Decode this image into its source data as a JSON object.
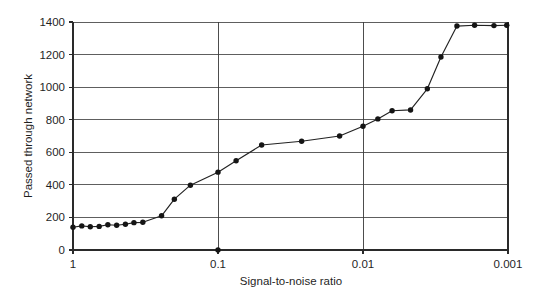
{
  "chart_data": {
    "type": "line",
    "title": "",
    "xlabel": "Signal-to-noise ratio",
    "ylabel": "Passed through network",
    "xscale": "log",
    "x_axis_reversed": true,
    "grid": true,
    "legend": "none",
    "xlim": [
      1,
      0.001
    ],
    "ylim": [
      0,
      1400
    ],
    "x_tick_labels": [
      "1",
      "0.1",
      "0.01",
      "0.001"
    ],
    "x_ticks": [
      1,
      0.1,
      0.01,
      0.001
    ],
    "y_tick_labels": [
      "0",
      "200",
      "400",
      "600",
      "800",
      "1000",
      "1200",
      "1400"
    ],
    "y_ticks": [
      0,
      200,
      400,
      600,
      800,
      1000,
      1200,
      1400
    ],
    "marker": "filled-circle",
    "x": [
      1.0,
      0.87,
      0.76,
      0.66,
      0.575,
      0.5,
      0.435,
      0.38,
      0.33,
      0.245,
      0.2,
      0.155,
      0.1,
      0.075,
      0.05,
      0.0265,
      0.0145,
      0.01,
      0.0079,
      0.0063,
      0.0047,
      0.0036,
      0.0029,
      0.00225,
      0.0017,
      0.00125,
      0.00102
    ],
    "values": [
      140,
      148,
      143,
      145,
      155,
      152,
      158,
      168,
      170,
      210,
      312,
      398,
      478,
      548,
      645,
      668,
      700,
      760,
      805,
      855,
      860,
      990,
      1185,
      1375,
      1380,
      1378,
      1380
    ],
    "annotations": [
      {
        "label": "axis-tick-artifact",
        "x": 0.1,
        "y": 0
      }
    ]
  },
  "axis": {
    "y_title": "Passed through network",
    "x_title": "Signal-to-noise ratio"
  },
  "colors": {
    "line": "#222222",
    "marker": "#151515",
    "grid": "#4d4d4d",
    "axis": "#2a2a2a",
    "background": "#ffffff"
  }
}
